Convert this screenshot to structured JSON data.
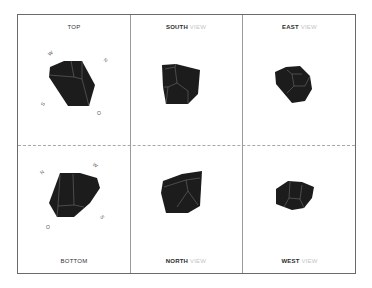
{
  "views": {
    "top": {
      "label": "TOP",
      "compass": {
        "w": "W",
        "n": "N",
        "s": "S",
        "o": "O"
      }
    },
    "south": {
      "primary": "SOUTH",
      "secondary": "VIEW"
    },
    "east": {
      "primary": "EAST",
      "secondary": "VIEW"
    },
    "bottom": {
      "label": "BOTTOM",
      "compass": {
        "n": "N",
        "w": "W",
        "s": "S",
        "o": "O"
      }
    },
    "north": {
      "primary": "NORTH",
      "secondary": "VIEW"
    },
    "west": {
      "primary": "WEST",
      "secondary": "VIEW"
    }
  },
  "colors": {
    "gem_fill": "#1c1c1c",
    "facet_line": "#7a7a7a",
    "frame": "#6a6a6a"
  }
}
